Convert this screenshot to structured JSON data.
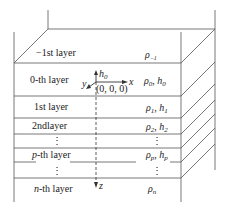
{
  "layers": [
    {
      "name": "-1st layer",
      "prop": "ρ₋₁"
    },
    {
      "name": "0-th layer",
      "prop": "ρ₀, h₀"
    },
    {
      "name": "1st layer",
      "prop": "ρ₁, h₁"
    },
    {
      "name": "2ndlayer",
      "prop": "ρ₂, h₂"
    },
    {
      "name": "⋮",
      "prop": "⋮"
    },
    {
      "name": "p-th layer",
      "prop": "ρp, hp"
    },
    {
      "name": "⋮",
      "prop": "⋮"
    },
    {
      "name": "n-th layer",
      "prop": "ρn"
    }
  ],
  "axes": {
    "x": "x",
    "y": "y",
    "z": "z",
    "h0": "h₀",
    "origin": "(0, 0, 0)"
  },
  "labels": {
    "minus1_a": "−1st layer",
    "minus1_rho": "ρ",
    "minus1_sub": "−1",
    "l0_a": "0-th layer",
    "l1_a": "1st layer",
    "l2_a": "2ndlayer",
    "lp_p": "p",
    "lp_a": "-th layer",
    "ln_n": "n",
    "ln_a": "-th layer",
    "vdots": "⋮",
    "rho": "ρ",
    "h": "h",
    "comma": ", ",
    "s0": "0",
    "s1": "1",
    "s2": "2",
    "sp": "p",
    "sn": "n"
  }
}
